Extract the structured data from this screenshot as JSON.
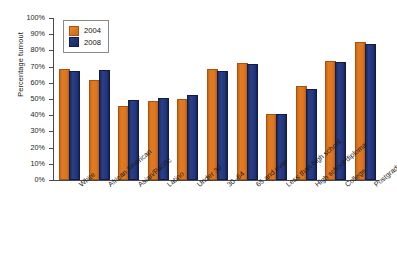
{
  "chart_data": {
    "type": "bar",
    "title": "",
    "subtitle": "",
    "xlabel": "",
    "ylabel": "Percentage turnout",
    "ylim": [
      0,
      100
    ],
    "grid": false,
    "legend_position": "top-left",
    "y_ticks": [
      "0%",
      "10%",
      "20%",
      "30%",
      "40%",
      "50%",
      "60%",
      "70%",
      "80%",
      "90%",
      "100%"
    ],
    "y_tick_values": [
      0,
      10,
      20,
      30,
      40,
      50,
      60,
      70,
      80,
      90,
      100
    ],
    "categories": [
      "White",
      "African American",
      "Asian/Pacific",
      "Latino",
      "Under 30",
      "30–64",
      "65 and over",
      "Less than high school",
      "High school diploma",
      "College",
      "Postgraduate"
    ],
    "series": [
      {
        "name": "2004",
        "color": "#dd7520",
        "values": [
          67,
          60.5,
          44.5,
          47.5,
          49,
          67,
          71,
          39.5,
          56.5,
          72,
          84
        ]
      },
      {
        "name": "2008",
        "color": "#22357c",
        "values": [
          66,
          66.5,
          48,
          49.5,
          51,
          66,
          70.5,
          39.5,
          55,
          71.5,
          83
        ]
      }
    ]
  },
  "colors": {
    "series_2004": "#dd7520",
    "series_2008": "#22357c",
    "axis": "#4a4a4a",
    "text": "#1a1a1a",
    "background": "#ffffff"
  }
}
